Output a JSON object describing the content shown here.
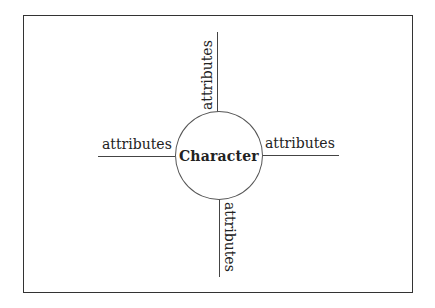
{
  "diagram": {
    "center": {
      "label": "Character"
    },
    "branches": [
      {
        "position": "top",
        "label": "attributes"
      },
      {
        "position": "left",
        "label": "attributes"
      },
      {
        "position": "right",
        "label": "attributes"
      },
      {
        "position": "bottom",
        "label": "attributes"
      }
    ]
  }
}
